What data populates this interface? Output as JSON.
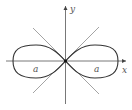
{
  "figure": {
    "type": "lemniscate of Bernoulli with tangent lines at origin",
    "axes": {
      "x_label": "x",
      "y_label": "y"
    },
    "labels": {
      "left_lobe": "a",
      "right_lobe": "a"
    },
    "colors": {
      "curve": "#333333",
      "axes": "#444444",
      "tangents": "#999999",
      "origin_dot": "#111111"
    }
  }
}
